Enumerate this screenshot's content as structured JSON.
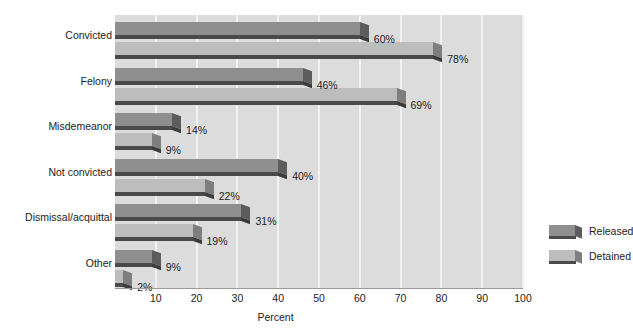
{
  "chart_data": {
    "type": "bar",
    "orientation": "horizontal",
    "title": "",
    "xlabel": "Percent",
    "ylabel": "",
    "xlim": [
      0,
      100
    ],
    "xticks": [
      10,
      20,
      30,
      40,
      50,
      60,
      70,
      80,
      90,
      100
    ],
    "grid": true,
    "legend_position": "right-inside",
    "categories": [
      "Convicted",
      "Felony",
      "Misdemeanor",
      "Not convicted",
      "Dismissal/acquittal",
      "Other"
    ],
    "series": [
      {
        "name": "Released",
        "color": "#8f8f8f",
        "values": [
          60,
          46,
          14,
          40,
          31,
          9
        ],
        "labels": [
          "60%",
          "46%",
          "14%",
          "40%",
          "31%",
          "9%"
        ]
      },
      {
        "name": "Detained",
        "color": "#bdbdbd",
        "values": [
          78,
          69,
          9,
          22,
          19,
          2
        ],
        "labels": [
          "78%",
          "69%",
          "9%",
          "22%",
          "19%",
          "2%"
        ]
      }
    ]
  },
  "axis": {
    "x_title": "Percent",
    "tick_labels": [
      "10",
      "20",
      "30",
      "40",
      "50",
      "60",
      "70",
      "80",
      "90",
      "100"
    ]
  },
  "legend": {
    "items": [
      {
        "label": "Released"
      },
      {
        "label": "Detained"
      }
    ]
  },
  "colors": {
    "plot_background": "#dcdcdc",
    "gridline": "#f2f2f2",
    "released": "#8f8f8f",
    "detained": "#bdbdbd",
    "shadow": "#4a4a4a",
    "text": "#1c1c1c"
  }
}
